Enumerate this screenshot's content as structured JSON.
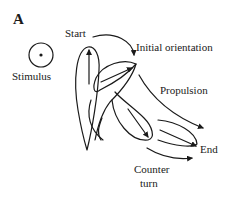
{
  "figure": {
    "panel_label": "A",
    "labels": {
      "stimulus": "Stimulus",
      "start": "Start",
      "initial_orientation": "Initial orientation",
      "propulsion": "Propulsion",
      "end": "End",
      "counter_turn_line1": "Counter",
      "counter_turn_line2": "turn"
    },
    "colors": {
      "ink": "#1a1a1a",
      "background": "#ffffff"
    }
  }
}
